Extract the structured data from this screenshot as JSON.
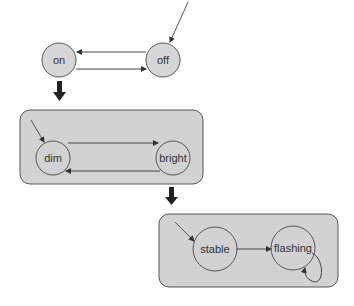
{
  "diagram": {
    "type": "hierarchical-state-machine",
    "colors": {
      "state_fill": "#d6d6d6",
      "state_stroke": "#555555",
      "composite_fill": "#d2d2d2",
      "composite_stroke": "#555555",
      "edge": "#444444",
      "refine_arrow": "#222222"
    },
    "level1": {
      "states": [
        {
          "id": "on",
          "label": "on"
        },
        {
          "id": "off",
          "label": "off",
          "initial": true
        }
      ],
      "transitions": [
        {
          "from": "off",
          "to": "on"
        },
        {
          "from": "on",
          "to": "off"
        }
      ]
    },
    "level2": {
      "refines": "on",
      "states": [
        {
          "id": "dim",
          "label": "dim",
          "initial": true
        },
        {
          "id": "bright",
          "label": "bright"
        }
      ],
      "transitions": [
        {
          "from": "dim",
          "to": "bright"
        },
        {
          "from": "bright",
          "to": "dim"
        }
      ]
    },
    "level3": {
      "refines": "bright",
      "states": [
        {
          "id": "stable",
          "label": "stable",
          "initial": true
        },
        {
          "id": "flashing",
          "label": "flashing"
        }
      ],
      "transitions": [
        {
          "from": "stable",
          "to": "flashing"
        },
        {
          "from": "flashing",
          "to": "flashing"
        }
      ]
    }
  }
}
